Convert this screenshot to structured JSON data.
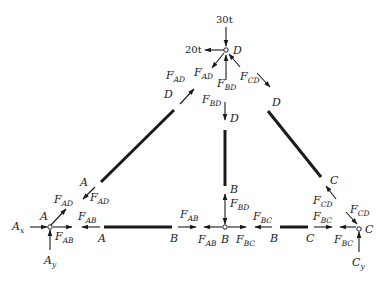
{
  "diagram": {
    "type": "truss free-body diagram",
    "loads": {
      "vertical_at_D": "30t",
      "horizontal_at_D": "20t"
    },
    "joints": {
      "A": {
        "label": "A",
        "reactions": {
          "x": "A",
          "x_sub": "x",
          "y": "A",
          "y_sub": "y"
        }
      },
      "B": {
        "label": "B"
      },
      "C": {
        "label": "C",
        "reactions": {
          "y": "C",
          "y_sub": "y"
        }
      },
      "D": {
        "label": "D"
      }
    },
    "members": [
      {
        "name": "AD",
        "ends": [
          "A",
          "D"
        ]
      },
      {
        "name": "BD",
        "ends": [
          "B",
          "D"
        ]
      },
      {
        "name": "CD",
        "ends": [
          "C",
          "D"
        ]
      },
      {
        "name": "AB",
        "ends": [
          "A",
          "B"
        ]
      },
      {
        "name": "BC",
        "ends": [
          "B",
          "C"
        ]
      }
    ],
    "forces": {
      "F": "F",
      "AD": "AD",
      "BD": "BD",
      "CD": "CD",
      "AB": "AB",
      "BC": "BC"
    },
    "end_labels": {
      "A": "A",
      "B": "B",
      "C": "C",
      "D": "D"
    }
  }
}
